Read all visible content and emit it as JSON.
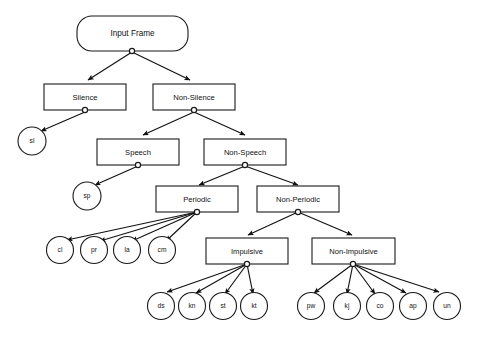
{
  "diagram": {
    "type": "hierarchy-tree",
    "background_color": "#ffffff",
    "line_color": "#111111",
    "node_fill": "#ffffff"
  },
  "nodes": {
    "root": {
      "label": "Input Frame",
      "shape": "rounded-rect"
    },
    "silence": {
      "label": "Silence",
      "shape": "rect"
    },
    "non_silence": {
      "label": "Non-Silence",
      "shape": "rect"
    },
    "speech": {
      "label": "Speech",
      "shape": "rect"
    },
    "non_speech": {
      "label": "Non-Speech",
      "shape": "rect"
    },
    "periodic": {
      "label": "Periodic",
      "shape": "rect"
    },
    "non_periodic": {
      "label": "Non-Periodic",
      "shape": "rect"
    },
    "impulsive": {
      "label": "Impulsive",
      "shape": "rect"
    },
    "non_impulsive": {
      "label": "Non-Impulsive",
      "shape": "rect"
    }
  },
  "leaves": {
    "sl": {
      "label": "sl",
      "parent": "Silence"
    },
    "sp": {
      "label": "sp",
      "parent": "Speech"
    },
    "periodic_children": [
      {
        "label": "cl"
      },
      {
        "label": "pr"
      },
      {
        "label": "la"
      },
      {
        "label": "cm"
      }
    ],
    "impulsive_children": [
      {
        "label": "ds"
      },
      {
        "label": "kn"
      },
      {
        "label": "st"
      },
      {
        "label": "kt"
      }
    ],
    "non_impulsive_children": [
      {
        "label": "pw"
      },
      {
        "label": "kj"
      },
      {
        "label": "co"
      },
      {
        "label": "ap"
      },
      {
        "label": "un"
      }
    ]
  }
}
